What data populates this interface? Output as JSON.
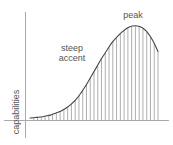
{
  "figure": {
    "title": "",
    "axis_label_y": "capabilities",
    "annotations": {
      "steep_line1": "steep",
      "steep_line2": "accent",
      "peak": "peak"
    },
    "colors": {
      "curve": "#444444",
      "hatch": "#999999",
      "axis": "#aaaaaa",
      "text": "#555555",
      "background": "#ffffff"
    }
  },
  "chart_data": {
    "type": "line",
    "title": "",
    "xlabel": "",
    "ylabel": "capabilities",
    "xlim": [
      0,
      100
    ],
    "ylim": [
      0,
      100
    ],
    "grid": false,
    "legend": null,
    "annotations": [
      {
        "text": "steep accent",
        "x": 30,
        "y": 62
      },
      {
        "text": "peak",
        "x": 79,
        "y": 98
      }
    ],
    "x": [
      0,
      4,
      8,
      12,
      16,
      20,
      24,
      28,
      32,
      36,
      40,
      44,
      48,
      52,
      56,
      60,
      64,
      68,
      72,
      76,
      80,
      84,
      88,
      92,
      96,
      100
    ],
    "y": [
      2,
      2.5,
      3,
      4,
      5,
      7,
      9,
      12,
      16,
      21,
      28,
      36,
      45,
      54,
      63,
      71,
      79,
      85,
      90,
      94,
      96,
      96,
      94,
      89,
      81,
      70
    ],
    "series": [
      {
        "name": "capabilities",
        "values": [
          2,
          2.5,
          3,
          4,
          5,
          7,
          9,
          12,
          16,
          21,
          28,
          36,
          45,
          54,
          63,
          71,
          79,
          85,
          90,
          94,
          96,
          96,
          94,
          89,
          81,
          70
        ]
      }
    ],
    "fill_style": "vertical-hatch",
    "hatch_count": 34
  }
}
